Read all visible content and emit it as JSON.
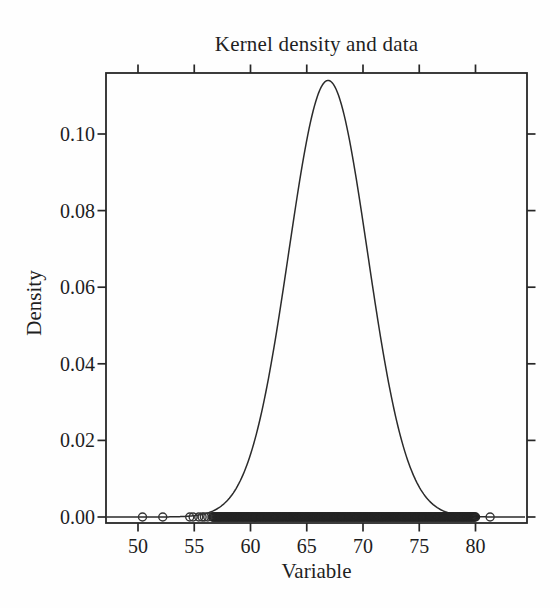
{
  "figure": {
    "background": "#fefefe",
    "ink_color": "#272727",
    "text_color": "#1d1d1d"
  },
  "chart_data": {
    "type": "line",
    "title": "Kernel density and data",
    "xlabel": "Variable",
    "ylabel": "Density",
    "xlim": [
      47.2,
      84.5
    ],
    "ylim": [
      0,
      0.116
    ],
    "grid": false,
    "legend": "none",
    "x_ticks": [
      {
        "value": 50,
        "label": "50"
      },
      {
        "value": 55,
        "label": "55"
      },
      {
        "value": 60,
        "label": "60"
      },
      {
        "value": 65,
        "label": "65"
      },
      {
        "value": 70,
        "label": "70"
      },
      {
        "value": 75,
        "label": "75"
      },
      {
        "value": 80,
        "label": "80"
      }
    ],
    "y_ticks": [
      {
        "value": 0.0,
        "label": "0.00"
      },
      {
        "value": 0.02,
        "label": "0.02"
      },
      {
        "value": 0.04,
        "label": "0.04"
      },
      {
        "value": 0.06,
        "label": "0.06"
      },
      {
        "value": 0.08,
        "label": "0.08"
      },
      {
        "value": 0.1,
        "label": "0.10"
      }
    ],
    "series": [
      {
        "name": "kernel-density-estimate",
        "style": "thin solid black curve",
        "gaussian": {
          "mean": 66.9,
          "sd": 3.5,
          "peak_density": 0.114
        },
        "points": [
          [
            48,
            0.0
          ],
          [
            50,
            0.0
          ],
          [
            52,
            0.0001
          ],
          [
            54,
            0.0002
          ],
          [
            56,
            0.0009
          ],
          [
            58,
            0.0045
          ],
          [
            60,
            0.0163
          ],
          [
            62,
            0.0428
          ],
          [
            64,
            0.0809
          ],
          [
            66,
            0.1103
          ],
          [
            66.9,
            0.114
          ],
          [
            68,
            0.1085
          ],
          [
            70,
            0.077
          ],
          [
            72,
            0.0394
          ],
          [
            74,
            0.0146
          ],
          [
            76,
            0.0039
          ],
          [
            78,
            0.0007
          ],
          [
            80,
            0.0001
          ],
          [
            82,
            0.0
          ],
          [
            84.5,
            0.0
          ]
        ]
      }
    ],
    "rug": {
      "marker": "open-circle",
      "y_value": 0,
      "dense_band_range": [
        56.6,
        80.0
      ],
      "dense_band_point_count": 300,
      "outlier_points": [
        50.4,
        52.2,
        54.6,
        54.9,
        55.4,
        55.7,
        55.9,
        56.2,
        81.3
      ]
    }
  }
}
